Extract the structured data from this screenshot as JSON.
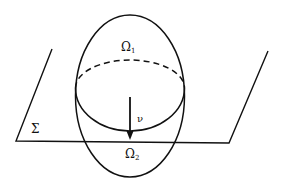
{
  "figure": {
    "stroke_color": "#111111",
    "background": "#ffffff",
    "labels": {
      "upper_region": {
        "symbol": "Ω",
        "subscript": "1"
      },
      "lower_region": {
        "symbol": "Ω",
        "subscript": "2"
      },
      "plane": {
        "symbol": "Σ"
      },
      "normal_vector": {
        "symbol": "ν"
      }
    }
  }
}
